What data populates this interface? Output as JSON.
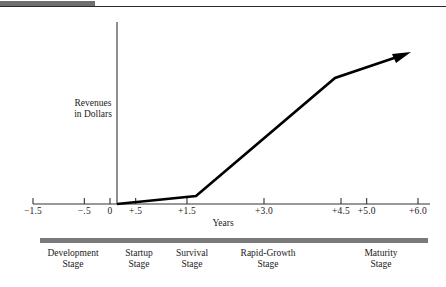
{
  "figure": {
    "y_axis_label_line1": "Revenues",
    "y_axis_label_line2": "in Dollars",
    "x_axis_title": "Years"
  },
  "chart_data": {
    "type": "line",
    "title": "",
    "subtitle": "",
    "xlabel": "Years",
    "ylabel": "Revenues in Dollars",
    "xlim": [
      -1.5,
      6.0
    ],
    "ylim": [
      0,
      100
    ],
    "grid": false,
    "legend": null,
    "xticks": [
      -1.5,
      -0.5,
      0,
      0.5,
      1.5,
      3.0,
      4.5,
      5.0,
      6.0
    ],
    "xticklabels": [
      "−1.5",
      "−.5",
      "0",
      "+.5",
      "+1.5",
      "+3.0",
      "+4.5",
      "+5.0",
      "+6.0"
    ],
    "yticks": [],
    "yticklabels": [],
    "series": [
      {
        "name": "Revenues",
        "x": [
          0,
          1.5,
          4.5,
          6.0
        ],
        "y": [
          0,
          6,
          86,
          102
        ],
        "arrow_at_end": true,
        "color": "#000000"
      }
    ],
    "annotations": [
      {
        "text": "Development Stage",
        "x_range": [
          -1.5,
          -0.5
        ]
      },
      {
        "text": "Startup Stage",
        "x_range": [
          -0.5,
          0.5
        ]
      },
      {
        "text": "Survival Stage",
        "x_range": [
          0.5,
          1.5
        ]
      },
      {
        "text": "Rapid-Growth Stage",
        "x_range": [
          1.5,
          4.5
        ]
      },
      {
        "text": "Maturity Stage",
        "x_range": [
          4.5,
          6.0
        ]
      }
    ]
  },
  "stages": [
    {
      "line1": "Development",
      "line2": "Stage",
      "center_px": 73
    },
    {
      "line1": "Startup",
      "line2": "Stage",
      "center_px": 139
    },
    {
      "line1": "Survival",
      "line2": "Stage",
      "center_px": 192
    },
    {
      "line1": "Rapid-Growth",
      "line2": "Stage",
      "center_px": 268
    },
    {
      "line1": "Maturity",
      "line2": "Stage",
      "center_px": 381
    }
  ],
  "colors": {
    "line": "#000000",
    "stage_bar": "#7a7a7a",
    "rule": "#2b2b2b",
    "background": "#ffffff"
  }
}
